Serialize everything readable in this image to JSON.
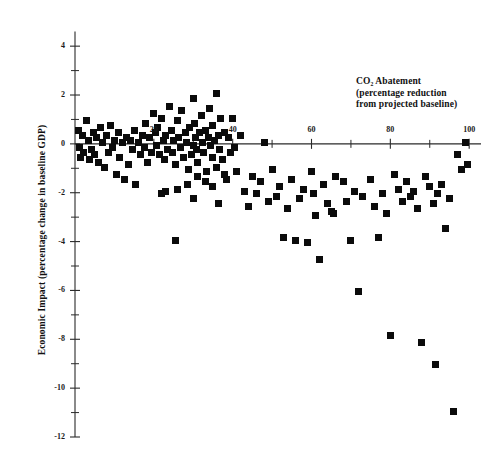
{
  "chart_data": {
    "type": "scatter",
    "title": "",
    "xlabel": "CO₂ Abatement (percentage reduction from projected baseline)",
    "xlabel_lines": [
      "CO₂ Abatement",
      "(percentage reduction",
      "from projected baseline)"
    ],
    "ylabel": "Economic Impact (percentage change in baseline GDP)",
    "xlim": [
      0,
      103
    ],
    "ylim": [
      -12,
      4.6
    ],
    "xticks": [
      20,
      40,
      60,
      80,
      100
    ],
    "xtick_labels": [
      "20",
      "40",
      "60",
      "80",
      "100"
    ],
    "xminor_ticks": [
      10,
      30,
      50,
      70,
      90
    ],
    "yticks": [
      4,
      2,
      0,
      -2,
      -4,
      -6,
      -8,
      -10,
      -12
    ],
    "ytick_labels": [
      "4",
      "2",
      "0",
      "-2",
      "-4",
      "-6",
      "-8",
      "-10",
      "-12"
    ],
    "yminor_ticks": [
      3,
      1,
      -1,
      -3,
      -5,
      -7,
      -9,
      -11
    ],
    "grid": false,
    "legend": null,
    "marker": "square",
    "marker_color": "#0b0b0b",
    "axis_color": "#2a2a2a",
    "points": [
      [
        1.0,
        0.55
      ],
      [
        1.2,
        -0.15
      ],
      [
        1.5,
        -0.55
      ],
      [
        2.0,
        0.35
      ],
      [
        2.2,
        -0.35
      ],
      [
        3.0,
        0.95
      ],
      [
        3.4,
        0.15
      ],
      [
        3.6,
        -0.65
      ],
      [
        4.2,
        -0.25
      ],
      [
        4.6,
        0.45
      ],
      [
        5.0,
        -0.45
      ],
      [
        5.5,
        0.25
      ],
      [
        6.0,
        -0.75
      ],
      [
        6.4,
        0.65
      ],
      [
        7.0,
        0.05
      ],
      [
        7.5,
        -0.95
      ],
      [
        8.0,
        0.35
      ],
      [
        8.6,
        -0.35
      ],
      [
        9.0,
        0.75
      ],
      [
        9.4,
        -0.15
      ],
      [
        10.0,
        0.15
      ],
      [
        10.5,
        -1.25
      ],
      [
        11.0,
        0.45
      ],
      [
        11.4,
        -0.55
      ],
      [
        12.0,
        0.05
      ],
      [
        12.6,
        -1.45
      ],
      [
        13.0,
        0.25
      ],
      [
        13.5,
        -0.85
      ],
      [
        14.0,
        0.15
      ],
      [
        14.6,
        -0.25
      ],
      [
        15.0,
        0.55
      ],
      [
        15.4,
        -1.65
      ],
      [
        16.0,
        0.05
      ],
      [
        16.5,
        -0.45
      ],
      [
        17.0,
        0.35
      ],
      [
        17.6,
        -0.15
      ],
      [
        18.0,
        0.85
      ],
      [
        18.4,
        -0.75
      ],
      [
        19.0,
        0.25
      ],
      [
        19.5,
        -0.35
      ],
      [
        20.0,
        1.25
      ],
      [
        20.3,
        0.45
      ],
      [
        20.6,
        -0.05
      ],
      [
        21.0,
        0.65
      ],
      [
        21.4,
        -0.45
      ],
      [
        22.0,
        1.05
      ],
      [
        22.4,
        0.15
      ],
      [
        22.8,
        -0.65
      ],
      [
        23.0,
        0.35
      ],
      [
        23.5,
        -0.25
      ],
      [
        24.0,
        1.55
      ],
      [
        24.4,
        0.55
      ],
      [
        24.8,
        -0.35
      ],
      [
        25.0,
        0.15
      ],
      [
        25.4,
        -0.85
      ],
      [
        26.0,
        0.95
      ],
      [
        26.3,
        0.25
      ],
      [
        26.7,
        -0.15
      ],
      [
        27.0,
        1.35
      ],
      [
        27.4,
        -0.55
      ],
      [
        28.0,
        0.45
      ],
      [
        28.4,
        0.05
      ],
      [
        28.8,
        -1.05
      ],
      [
        29.0,
        0.65
      ],
      [
        29.5,
        -0.45
      ],
      [
        30.0,
        1.85
      ],
      [
        30.3,
        0.85
      ],
      [
        30.6,
        0.25
      ],
      [
        30.9,
        -0.25
      ],
      [
        31.2,
        -0.75
      ],
      [
        31.6,
        0.45
      ],
      [
        32.0,
        1.15
      ],
      [
        32.3,
        0.05
      ],
      [
        32.7,
        -0.35
      ],
      [
        33.0,
        0.55
      ],
      [
        33.4,
        -1.15
      ],
      [
        33.8,
        0.25
      ],
      [
        34.0,
        1.45
      ],
      [
        34.4,
        -0.05
      ],
      [
        34.8,
        -0.55
      ],
      [
        35.0,
        0.75
      ],
      [
        35.4,
        0.15
      ],
      [
        35.8,
        -0.95
      ],
      [
        36.0,
        2.05
      ],
      [
        36.3,
        0.35
      ],
      [
        36.7,
        -0.25
      ],
      [
        37.0,
        1.05
      ],
      [
        37.4,
        -0.65
      ],
      [
        38.0,
        0.45
      ],
      [
        38.5,
        -1.45
      ],
      [
        39.0,
        0.25
      ],
      [
        39.5,
        -0.35
      ],
      [
        22.0,
        -2.05
      ],
      [
        23.0,
        -1.95
      ],
      [
        26.0,
        -1.85
      ],
      [
        28.5,
        -1.65
      ],
      [
        30.0,
        -2.25
      ],
      [
        31.0,
        -1.35
      ],
      [
        33.0,
        -1.55
      ],
      [
        35.0,
        -1.75
      ],
      [
        36.5,
        -2.45
      ],
      [
        38.0,
        -1.25
      ],
      [
        25.5,
        -3.95
      ],
      [
        30.0,
        -0.05
      ],
      [
        40.0,
        1.05
      ],
      [
        40.5,
        -0.15
      ],
      [
        41.0,
        -1.15
      ],
      [
        42.0,
        0.35
      ],
      [
        43.0,
        -1.95
      ],
      [
        44.0,
        -2.55
      ],
      [
        45.0,
        -1.35
      ],
      [
        46.0,
        -2.05
      ],
      [
        47.0,
        -1.55
      ],
      [
        48.0,
        0.05
      ],
      [
        49.0,
        -2.35
      ],
      [
        50.0,
        -1.05
      ],
      [
        51.0,
        -2.15
      ],
      [
        52.0,
        -1.75
      ],
      [
        53.0,
        -3.85
      ],
      [
        54.0,
        -2.65
      ],
      [
        55.0,
        -1.45
      ],
      [
        56.0,
        -3.95
      ],
      [
        57.0,
        -2.25
      ],
      [
        58.0,
        -1.85
      ],
      [
        59.0,
        -4.05
      ],
      [
        60.0,
        -1.15
      ],
      [
        60.5,
        -2.05
      ],
      [
        61.0,
        -2.95
      ],
      [
        62.0,
        -4.75
      ],
      [
        63.0,
        -1.65
      ],
      [
        64.0,
        -2.45
      ],
      [
        65.0,
        -2.75
      ],
      [
        65.5,
        -2.85
      ],
      [
        66.0,
        -1.35
      ],
      [
        68.0,
        -1.55
      ],
      [
        69.0,
        -2.35
      ],
      [
        70.0,
        -3.95
      ],
      [
        71.0,
        -1.95
      ],
      [
        72.0,
        -6.05
      ],
      [
        73.0,
        -2.15
      ],
      [
        75.0,
        -1.45
      ],
      [
        76.0,
        -2.55
      ],
      [
        77.0,
        -3.85
      ],
      [
        78.0,
        -2.05
      ],
      [
        79.0,
        -2.85
      ],
      [
        80.0,
        -7.85
      ],
      [
        81.0,
        -1.25
      ],
      [
        82.0,
        -1.85
      ],
      [
        83.0,
        -2.35
      ],
      [
        84.0,
        -1.55
      ],
      [
        85.0,
        -2.15
      ],
      [
        86.0,
        -1.95
      ],
      [
        87.0,
        -2.65
      ],
      [
        88.0,
        -8.15
      ],
      [
        89.0,
        -1.35
      ],
      [
        90.0,
        -1.75
      ],
      [
        91.0,
        -2.45
      ],
      [
        91.5,
        -9.05
      ],
      [
        92.0,
        -2.05
      ],
      [
        93.0,
        -1.65
      ],
      [
        94.0,
        -3.45
      ],
      [
        95.0,
        -2.25
      ],
      [
        96.0,
        -10.95
      ],
      [
        97.0,
        -0.45
      ],
      [
        98.0,
        -1.05
      ],
      [
        99.0,
        0.05
      ],
      [
        99.5,
        -0.85
      ]
    ]
  }
}
